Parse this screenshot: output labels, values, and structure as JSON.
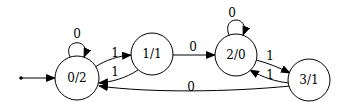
{
  "diagram": {
    "type": "state-machine",
    "start_state": "0/2",
    "nodes": [
      {
        "id": "n0",
        "label": "0/2",
        "cx": 77,
        "cy": 78,
        "r": 22
      },
      {
        "id": "n1",
        "label": "1/1",
        "cx": 152,
        "cy": 54,
        "r": 21
      },
      {
        "id": "n2",
        "label": "2/0",
        "cx": 236,
        "cy": 55,
        "r": 21
      },
      {
        "id": "n3",
        "label": "3/1",
        "cx": 309,
        "cy": 80,
        "r": 21
      }
    ],
    "edges": [
      {
        "from": "0/2",
        "to": "0/2",
        "label": "0"
      },
      {
        "from": "0/2",
        "to": "1/1",
        "label": "1"
      },
      {
        "from": "1/1",
        "to": "0/2",
        "label": "1"
      },
      {
        "from": "1/1",
        "to": "2/0",
        "label": "0"
      },
      {
        "from": "2/0",
        "to": "2/0",
        "label": "0"
      },
      {
        "from": "2/0",
        "to": "3/1",
        "label": "1"
      },
      {
        "from": "3/1",
        "to": "2/0",
        "label": "1"
      },
      {
        "from": "3/1",
        "to": "0/2",
        "label": "0"
      }
    ]
  }
}
